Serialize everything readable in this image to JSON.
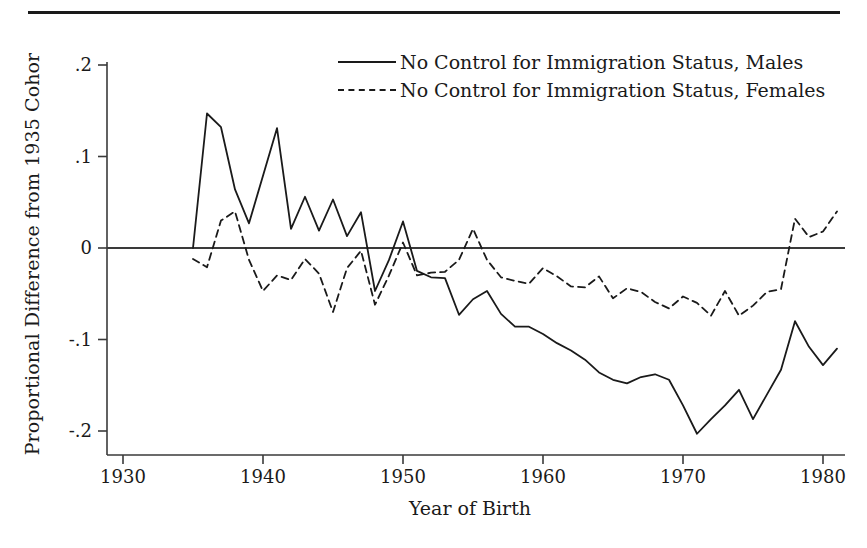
{
  "figure": {
    "top_rule": "horizontal-rule"
  },
  "chart_data": {
    "type": "line",
    "title": "",
    "xlabel": "Year of Birth",
    "ylabel": "Proportional Difference from 1935 Cohor",
    "xlim": [
      1929.0,
      1982.0
    ],
    "ylim": [
      -0.225,
      0.225
    ],
    "xticks": [
      1930,
      1940,
      1950,
      1960,
      1970,
      1980
    ],
    "xticklabels": [
      "1930",
      "1940",
      "1950",
      "1960",
      "1970",
      "1980"
    ],
    "yticks": [
      0.2,
      0.1,
      0,
      -0.1,
      -0.2
    ],
    "yticklabels": [
      ".2",
      ".1",
      "0",
      "-.1",
      "-.2"
    ],
    "grid": false,
    "zero_line": true,
    "legend_position": "top-center",
    "line_color": "#1a1a1a",
    "series": [
      {
        "name": "No Control for Immigration Status, Males",
        "style": "solid",
        "x": [
          1935,
          1936,
          1937,
          1938,
          1939,
          1940,
          1941,
          1942,
          1943,
          1944,
          1945,
          1946,
          1947,
          1948,
          1949,
          1950,
          1951,
          1952,
          1953,
          1954,
          1955,
          1956,
          1957,
          1958,
          1959,
          1960,
          1961,
          1962,
          1963,
          1964,
          1965,
          1966,
          1967,
          1968,
          1969,
          1970,
          1971,
          1972,
          1973,
          1974,
          1975,
          1976,
          1977,
          1978,
          1979,
          1980,
          1981
        ],
        "values": [
          0.0,
          0.147,
          0.132,
          0.064,
          0.027,
          0.079,
          0.131,
          0.021,
          0.056,
          0.019,
          0.053,
          0.013,
          0.039,
          -0.047,
          -0.013,
          0.029,
          -0.025,
          -0.032,
          -0.033,
          -0.073,
          -0.056,
          -0.047,
          -0.072,
          -0.086,
          -0.086,
          -0.094,
          -0.104,
          -0.112,
          -0.122,
          -0.136,
          -0.144,
          -0.148,
          -0.141,
          -0.138,
          -0.144,
          -0.172,
          -0.203,
          -0.187,
          -0.172,
          -0.155,
          -0.187,
          -0.16,
          -0.133,
          -0.08,
          -0.108,
          -0.128,
          -0.11
        ]
      },
      {
        "name": "No Control for Immigration Status, Females",
        "style": "dashed",
        "x": [
          1935,
          1936,
          1937,
          1938,
          1939,
          1940,
          1941,
          1942,
          1943,
          1944,
          1945,
          1946,
          1947,
          1948,
          1949,
          1950,
          1951,
          1952,
          1953,
          1954,
          1955,
          1956,
          1957,
          1958,
          1959,
          1960,
          1961,
          1962,
          1963,
          1964,
          1965,
          1966,
          1967,
          1968,
          1969,
          1970,
          1971,
          1972,
          1973,
          1974,
          1975,
          1976,
          1977,
          1978,
          1979,
          1980,
          1981
        ],
        "values": [
          -0.012,
          -0.021,
          0.03,
          0.04,
          -0.013,
          -0.047,
          -0.03,
          -0.035,
          -0.012,
          -0.028,
          -0.07,
          -0.022,
          -0.003,
          -0.062,
          -0.03,
          0.006,
          -0.03,
          -0.027,
          -0.026,
          -0.013,
          0.021,
          -0.013,
          -0.032,
          -0.036,
          -0.039,
          -0.022,
          -0.031,
          -0.042,
          -0.043,
          -0.031,
          -0.055,
          -0.044,
          -0.048,
          -0.059,
          -0.066,
          -0.053,
          -0.06,
          -0.074,
          -0.047,
          -0.074,
          -0.063,
          -0.048,
          -0.045,
          0.032,
          0.012,
          0.018,
          0.04
        ]
      }
    ]
  }
}
